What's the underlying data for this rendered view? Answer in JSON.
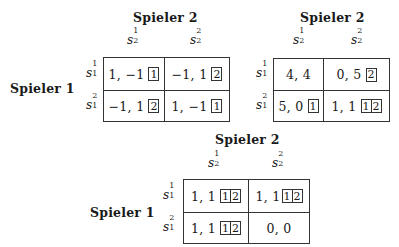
{
  "games": [
    {
      "id": "game1",
      "col_player": "Spieler 2",
      "row_player": "Spieler 1",
      "col_strategies": [
        {
          "base": "s",
          "sub": "2",
          "sup": "1"
        },
        {
          "base": "s",
          "sub": "2",
          "sup": "2"
        }
      ],
      "row_strategies": [
        {
          "base": "s",
          "sub": "1",
          "sup": "1"
        },
        {
          "base": "s",
          "sub": "1",
          "sup": "2"
        }
      ],
      "cells": [
        [
          {
            "payoff": "1, −1",
            "best_response": [
              "1"
            ]
          },
          {
            "payoff": "−1, 1",
            "best_response": [
              "2"
            ]
          }
        ],
        [
          {
            "payoff": "−1, 1",
            "best_response": [
              "2"
            ]
          },
          {
            "payoff": "1, −1",
            "best_response": [
              "1"
            ]
          }
        ]
      ]
    },
    {
      "id": "game2",
      "col_player": "Spieler 2",
      "row_player": "",
      "col_strategies": [
        {
          "base": "s",
          "sub": "2",
          "sup": "1"
        },
        {
          "base": "s",
          "sub": "2",
          "sup": "2"
        }
      ],
      "row_strategies": [
        {
          "base": "s",
          "sub": "1",
          "sup": "1"
        },
        {
          "base": "s",
          "sub": "1",
          "sup": "2"
        }
      ],
      "cells": [
        [
          {
            "payoff": "4, 4",
            "best_response": []
          },
          {
            "payoff": "0, 5",
            "best_response": [
              "2"
            ]
          }
        ],
        [
          {
            "payoff": "5, 0",
            "best_response": [
              "1"
            ]
          },
          {
            "payoff": "1, 1",
            "best_response": [
              "1",
              "2"
            ]
          }
        ]
      ]
    },
    {
      "id": "game3",
      "col_player": "Spieler 2",
      "row_player": "Spieler 1",
      "col_strategies": [
        {
          "base": "s",
          "sub": "2",
          "sup": "1"
        },
        {
          "base": "s",
          "sub": "2",
          "sup": "2"
        }
      ],
      "row_strategies": [
        {
          "base": "s",
          "sub": "1",
          "sup": "1"
        },
        {
          "base": "s",
          "sub": "1",
          "sup": "2"
        }
      ],
      "cells": [
        [
          {
            "payoff": "1, 1",
            "best_response": [
              "1",
              "2"
            ]
          },
          {
            "payoff": "1, 1",
            "best_response": [
              "1",
              "2"
            ]
          }
        ],
        [
          {
            "payoff": "1, 1",
            "best_response": [
              "1",
              "2"
            ]
          },
          {
            "payoff": "0, 0",
            "best_response": []
          }
        ]
      ]
    }
  ]
}
